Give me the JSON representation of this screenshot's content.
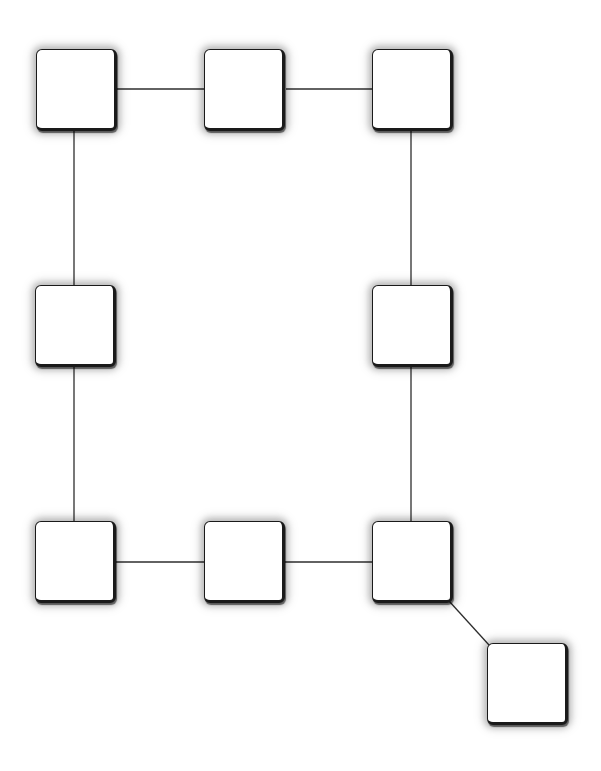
{
  "diagram": {
    "type": "graph",
    "background": "#ffffff",
    "node_size": {
      "width": 81,
      "height": 82
    },
    "nodes": [
      {
        "id": "n1",
        "label": "",
        "x": 36,
        "y": 49
      },
      {
        "id": "n2",
        "label": "",
        "x": 204,
        "y": 49
      },
      {
        "id": "n3",
        "label": "",
        "x": 372,
        "y": 49
      },
      {
        "id": "n4",
        "label": "",
        "x": 35,
        "y": 285
      },
      {
        "id": "n5",
        "label": "",
        "x": 372,
        "y": 285
      },
      {
        "id": "n6",
        "label": "",
        "x": 35,
        "y": 521
      },
      {
        "id": "n7",
        "label": "",
        "x": 204,
        "y": 521
      },
      {
        "id": "n8",
        "label": "",
        "x": 372,
        "y": 521
      },
      {
        "id": "n9",
        "label": "",
        "x": 487,
        "y": 643
      }
    ],
    "edges": [
      {
        "from": "n1",
        "to": "n2",
        "x1": 117,
        "y1": 89,
        "x2": 204,
        "y2": 89
      },
      {
        "from": "n2",
        "to": "n3",
        "x1": 286,
        "y1": 89,
        "x2": 372,
        "y2": 89
      },
      {
        "from": "n1",
        "to": "n4",
        "x1": 74,
        "y1": 131,
        "x2": 74,
        "y2": 285
      },
      {
        "from": "n3",
        "to": "n5",
        "x1": 411,
        "y1": 131,
        "x2": 411,
        "y2": 285
      },
      {
        "from": "n4",
        "to": "n6",
        "x1": 74,
        "y1": 367,
        "x2": 74,
        "y2": 521
      },
      {
        "from": "n5",
        "to": "n8",
        "x1": 411,
        "y1": 367,
        "x2": 411,
        "y2": 521
      },
      {
        "from": "n6",
        "to": "n7",
        "x1": 116,
        "y1": 562,
        "x2": 204,
        "y2": 562
      },
      {
        "from": "n7",
        "to": "n8",
        "x1": 284,
        "y1": 562,
        "x2": 372,
        "y2": 562
      },
      {
        "from": "n8",
        "to": "n9",
        "x1": 449,
        "y1": 601,
        "x2": 489,
        "y2": 645
      }
    ]
  }
}
